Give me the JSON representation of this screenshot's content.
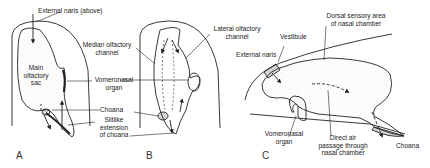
{
  "figure": {
    "panels": [
      {
        "id": "A",
        "letter": "A",
        "labels": {
          "external_naris": "External naris (above)",
          "main_sac_1": "Main",
          "main_sac_2": "olfactory",
          "main_sac_3": "sac",
          "vomeronasal_1": "Vomeronasal",
          "vomeronasal_2": "organ",
          "choana": "Choana",
          "slitlike_1": "Slitlike",
          "slitlike_2": "extension",
          "slitlike_3": "of choana"
        }
      },
      {
        "id": "B",
        "letter": "B",
        "labels": {
          "median_1": "Median olfactory",
          "median_2": "channel",
          "lateral_1": "Lateral olfactory",
          "lateral_2": "channel"
        }
      },
      {
        "id": "C",
        "letter": "C",
        "labels": {
          "external_naris": "External naris",
          "vestibule": "Vestibule",
          "dorsal_1": "Dorsal sensory area",
          "dorsal_2": "of nasal chamber",
          "vomeronasal_1": "Vomeronasal",
          "vomeronasal_2": "organ",
          "direct_1": "Direct air",
          "direct_2": "passage through",
          "direct_3": "nasal chamber",
          "choana": "Choana"
        }
      }
    ]
  }
}
